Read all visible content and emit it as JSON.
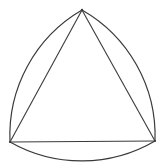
{
  "diagram": {
    "shape": "reuleaux-triangle",
    "components": [
      "inscribed equilateral triangle",
      "three circular arcs centered at opposite vertices"
    ],
    "vertices": [
      "top",
      "bottom-left",
      "bottom-right"
    ],
    "stroke_color": "#3a3a3a",
    "background_color": "#ffffff"
  }
}
